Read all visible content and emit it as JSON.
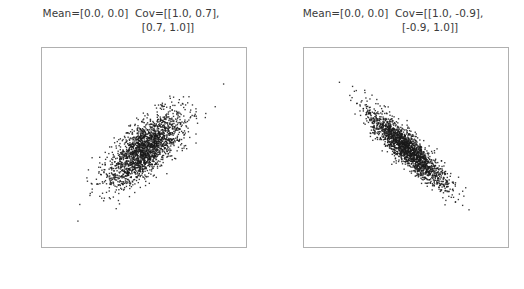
{
  "figure": {
    "width": 524,
    "height": 289,
    "background": "#ffffff",
    "marker_color": "#1a1a1a",
    "spine_color": "#b0b0b0",
    "text_color": "#3b3b3b",
    "tick_color": "#6e6e6e"
  },
  "chart_data": [
    {
      "type": "scatter",
      "title": "Mean=[0.0, 0.0]  Cov=[[1.0, 0.7],",
      "title_line2": "[0.7, 1.0]]",
      "xlabel": "",
      "ylabel": "",
      "mean": [
        0.0,
        0.0
      ],
      "cov": [
        [
          1.0,
          0.7
        ],
        [
          0.7,
          1.0
        ]
      ],
      "correlation": 0.7,
      "n_points": 2000,
      "xlim": [
        -5.4,
        5.4
      ],
      "ylim": [
        -5.4,
        5.4
      ],
      "xticks": [
        -4,
        -2,
        0,
        2,
        4
      ],
      "yticks": [
        -4,
        -2,
        0,
        2,
        4
      ],
      "xticklabels": [
        "-4",
        "-2",
        "0",
        "2",
        "4"
      ],
      "yticklabels": [
        "-4",
        "-2",
        "0",
        "2",
        "4"
      ],
      "grid": false,
      "legend": null,
      "marker_size": 1,
      "seed": 11
    },
    {
      "type": "scatter",
      "title": "Mean=[0.0, 0.0]  Cov=[[1.0, -0.9],",
      "title_line2": "[-0.9, 1.0]]",
      "xlabel": "",
      "ylabel": "",
      "mean": [
        0.0,
        0.0
      ],
      "cov": [
        [
          1.0,
          -0.9
        ],
        [
          -0.9,
          1.0
        ]
      ],
      "correlation": -0.9,
      "n_points": 2000,
      "xlim": [
        -5.4,
        5.4
      ],
      "ylim": [
        -5.4,
        5.4
      ],
      "xticks": [
        -4,
        -2,
        0,
        2,
        4
      ],
      "yticks": [
        -4,
        -2,
        0,
        2,
        4
      ],
      "xticklabels": [
        "-4",
        "-2",
        "0",
        "2",
        "4"
      ],
      "yticklabels": [
        "-4",
        "-2",
        "0",
        "2",
        "4"
      ],
      "grid": false,
      "legend": null,
      "marker_size": 1,
      "seed": 29
    }
  ]
}
